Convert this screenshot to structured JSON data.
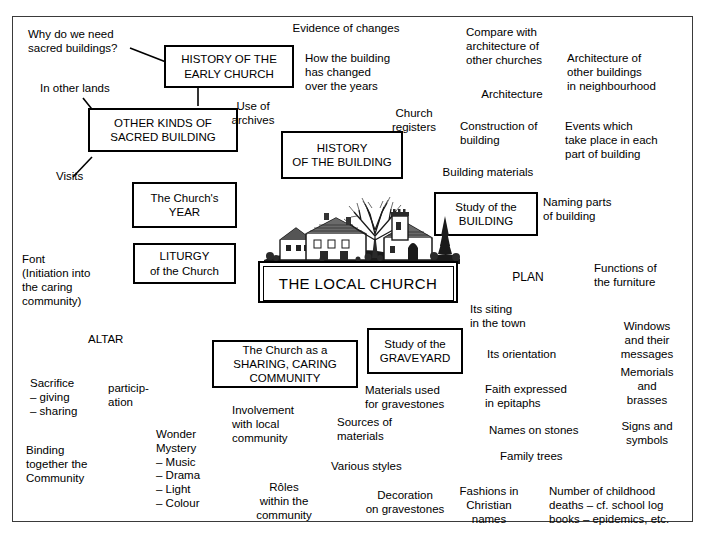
{
  "diagram": {
    "title": "THE LOCAL CHURCH",
    "type": "mind-map",
    "frame": {
      "border_color": "#3a3a3a"
    },
    "central": {
      "label": "THE LOCAL CHURCH",
      "illustration": "village-church-engraving"
    },
    "boxes": [
      {
        "id": "history-early-church",
        "label": "HISTORY OF THE\nEARLY CHURCH"
      },
      {
        "id": "other-kinds-sacred-building",
        "label": "OTHER KINDS OF\nSACRED BUILDING"
      },
      {
        "id": "church-year",
        "label": "The Church's\nYEAR"
      },
      {
        "id": "liturgy",
        "label": "LITURGY\nof the Church"
      },
      {
        "id": "history-of-building",
        "label": "HISTORY\nOF THE BUILDING"
      },
      {
        "id": "study-of-building",
        "label": "Study of the\nBUILDING"
      },
      {
        "id": "study-of-graveyard",
        "label": "Study of the\nGRAVEYARD"
      },
      {
        "id": "sharing-caring-community",
        "label": "The Church as a\nSHARING, CARING\nCOMMUNITY"
      }
    ],
    "leaves": [
      {
        "id": "why-sacred-buildings",
        "label": "Why do we need\nsacred buildings?"
      },
      {
        "id": "in-other-lands",
        "label": "In other lands"
      },
      {
        "id": "visits",
        "label": "Visits"
      },
      {
        "id": "evidence-of-changes",
        "label": "Evidence of changes"
      },
      {
        "id": "how-building-changed",
        "label": "How the building\nhas changed\nover the years"
      },
      {
        "id": "use-of-archives",
        "label": "Use of\narchives"
      },
      {
        "id": "church-registers",
        "label": "Church\nregisters"
      },
      {
        "id": "compare-architecture",
        "label": "Compare with\narchitecture of\nother churches"
      },
      {
        "id": "architecture",
        "label": "Architecture"
      },
      {
        "id": "architecture-other-buildings",
        "label": "Architecture of\nother buildings\nin neighbourhood"
      },
      {
        "id": "construction-of-building",
        "label": "Construction of\nbuilding"
      },
      {
        "id": "events-which-take-place",
        "label": "Events which\ntake place in each\npart of building"
      },
      {
        "id": "building-materials",
        "label": "Building materials"
      },
      {
        "id": "naming-parts-of-building",
        "label": "Naming parts\nof building"
      },
      {
        "id": "plan",
        "label": "PLAN"
      },
      {
        "id": "functions-of-furniture",
        "label": "Functions of\nthe furniture"
      },
      {
        "id": "windows-and-messages",
        "label": "Windows\nand their\nmessages"
      },
      {
        "id": "memorials-and-brasses",
        "label": "Memorials\nand\nbrasses"
      },
      {
        "id": "signs-and-symbols",
        "label": "Signs and\nsymbols"
      },
      {
        "id": "its-siting-in-town",
        "label": "Its siting\nin the town"
      },
      {
        "id": "its-orientation",
        "label": "Its orientation"
      },
      {
        "id": "faith-expressed-epitaphs",
        "label": "Faith expressed\nin epitaphs"
      },
      {
        "id": "names-on-stones",
        "label": "Names on stones"
      },
      {
        "id": "family-trees",
        "label": "Family trees"
      },
      {
        "id": "fashions-christian-names",
        "label": "Fashions in\nChristian\nnames"
      },
      {
        "id": "childhood-deaths",
        "label": "Number of childhood\ndeaths – cf. school log\nbooks – epidemics, etc."
      },
      {
        "id": "materials-used-gravestones",
        "label": "Materials used\nfor gravestones"
      },
      {
        "id": "sources-of-materials",
        "label": "Sources of\nmaterials"
      },
      {
        "id": "various-styles",
        "label": "Various styles"
      },
      {
        "id": "decoration-on-gravestones",
        "label": "Decoration\non gravestones"
      },
      {
        "id": "involvement-local-community",
        "label": "Involvement\nwith local\ncommunity"
      },
      {
        "id": "roles-within-community",
        "label": "Rôles\nwithin the\ncommunity"
      },
      {
        "id": "font-initiation",
        "label": "Font"
      },
      {
        "id": "font-initiation-sub",
        "label": "(Initiation into\nthe caring\ncommunity)"
      },
      {
        "id": "altar",
        "label": "ALTAR"
      },
      {
        "id": "sacrifice",
        "label": "Sacrifice\n– giving\n– sharing"
      },
      {
        "id": "participation",
        "label": "particip-\nation"
      },
      {
        "id": "binding-together",
        "label": "Binding\ntogether the\nCommunity"
      },
      {
        "id": "wonder-mystery",
        "label": "Wonder\nMystery\n– Music\n– Drama\n– Light\n– Colour"
      }
    ]
  }
}
